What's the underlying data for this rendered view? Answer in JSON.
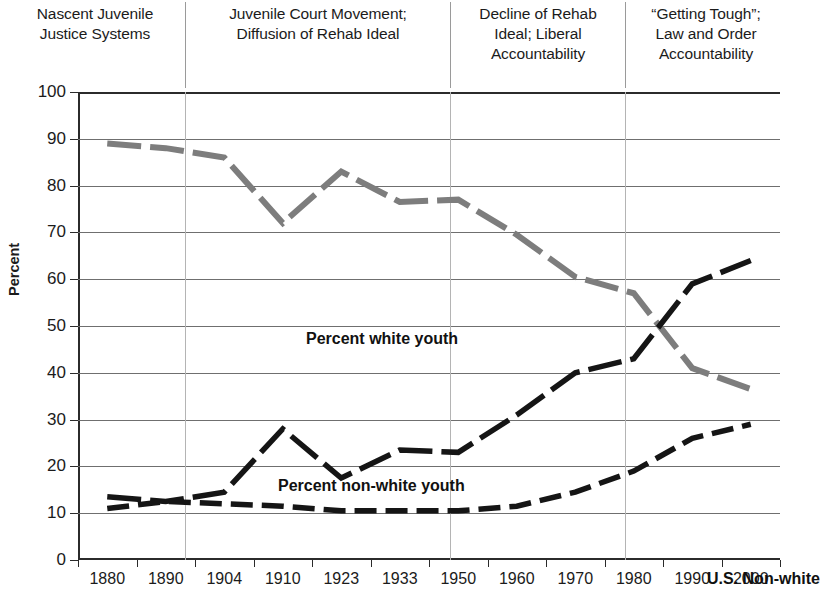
{
  "eras": [
    {
      "lines": [
        "Nascent Juvenile",
        "Justice Systems"
      ],
      "left": 8,
      "width": 174
    },
    {
      "lines": [
        "Juvenile Court Movement;",
        "Diffusion of Rehab Ideal"
      ],
      "left": 190,
      "width": 256
    },
    {
      "lines": [
        "Decline of Rehab",
        "Ideal; Liberal",
        "Accountability"
      ],
      "left": 454,
      "width": 168
    },
    {
      "lines": [
        "“Getting Tough”;",
        "Law and Order",
        "Accountability"
      ],
      "left": 630,
      "width": 152
    }
  ],
  "era_dividers": [
    185,
    450,
    625
  ],
  "axis": {
    "y_title": "Percent",
    "y_ticks": [
      "0",
      "10",
      "20",
      "30",
      "40",
      "50",
      "60",
      "70",
      "80",
      "90",
      "100"
    ],
    "x_ticks": [
      "1880",
      "1890",
      "1904",
      "1910",
      "1923",
      "1933",
      "1950",
      "1960",
      "1970",
      "1980",
      "1990",
      "2000"
    ]
  },
  "annotations": [
    {
      "text": "Percent white youth",
      "left": 228,
      "top": 238
    },
    {
      "text": "Percent non-white youth",
      "left": 200,
      "top": 385
    },
    {
      "text": "U.S. Non-white",
      "left": 629,
      "top": 478
    }
  ],
  "colors": {
    "white_youth_line": "#7d7d7d",
    "nonwhite_youth_line": "#151515",
    "us_nonwhite_line": "#151515",
    "gridline": "#6f6f6f",
    "vertical_gridline": "#b4b4b4",
    "axis": "#2b2b2b",
    "background": "#ffffff"
  },
  "chart_data": {
    "type": "line",
    "title": "",
    "xlabel": "",
    "ylabel": "Percent",
    "ylim": [
      0,
      100
    ],
    "ytick_step": 10,
    "grid": true,
    "legend": "inline-annotations",
    "categories": [
      "1880",
      "1890",
      "1904",
      "1910",
      "1923",
      "1933",
      "1950",
      "1960",
      "1970",
      "1980",
      "1990",
      "2000"
    ],
    "series": [
      {
        "name": "Percent white youth",
        "style": "dashed-thick-gray",
        "color": "#7d7d7d",
        "values": [
          89,
          88,
          86,
          72,
          83,
          76.5,
          77,
          69.5,
          60.5,
          57,
          41,
          36.5
        ]
      },
      {
        "name": "Percent non-white youth",
        "style": "dashed-thick-black",
        "color": "#151515",
        "values": [
          13.5,
          12.5,
          14.5,
          28,
          17.5,
          23.5,
          23,
          31,
          40,
          43,
          59,
          64
        ]
      },
      {
        "name": "U.S. Non-white",
        "style": "dashed-thick-black",
        "color": "#151515",
        "values": [
          11,
          12.5,
          12,
          11.5,
          10.5,
          10.5,
          10.5,
          11.5,
          14.5,
          19,
          26,
          29
        ]
      }
    ],
    "crossover_note": "white youth and non-white youth series cross near 1985 at about 50 percent"
  }
}
